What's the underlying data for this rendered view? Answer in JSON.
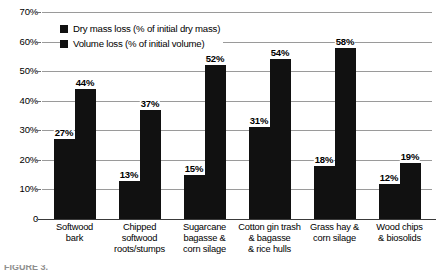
{
  "chart_data": {
    "type": "bar",
    "title": "",
    "xlabel": "",
    "ylabel": "",
    "ylim": [
      0,
      70
    ],
    "grid": true,
    "legend_position": "top-left-inside",
    "categories": [
      "Softwood\nbark",
      "Chipped\nsoftwood\nroots/stumps",
      "Sugarcane\nbagasse &\ncorn silage",
      "Cotton gin trash\n& bagasse\n& rice hulls",
      "Grass hay &\ncorn silage",
      "Wood chips\n& biosolids"
    ],
    "ytick_labels": [
      "70%",
      "60%",
      "50%",
      "40%",
      "30%",
      "20%",
      "10%",
      "0"
    ],
    "ytick_values": [
      70,
      60,
      50,
      40,
      30,
      20,
      10,
      0
    ],
    "series": [
      {
        "name": "Dry mass loss (% of initial dry mass)",
        "color": "#111111",
        "values": [
          27,
          13,
          15,
          31,
          18,
          12
        ],
        "labels": [
          "27%",
          "13%",
          "15%",
          "31%",
          "18%",
          "12%"
        ]
      },
      {
        "name": "Volume loss (% of initial volume)",
        "color": "#111111",
        "values": [
          44,
          37,
          52,
          54,
          58,
          19
        ],
        "labels": [
          "44%",
          "37%",
          "52%",
          "54%",
          "58%",
          "19%"
        ]
      }
    ]
  },
  "categories_display": [
    [
      "Softwood",
      "bark"
    ],
    [
      "Chipped",
      "softwood",
      "roots/stumps"
    ],
    [
      "Sugarcane",
      "bagasse &",
      "corn silage"
    ],
    [
      "Cotton gin trash",
      "& bagasse",
      "& rice hulls"
    ],
    [
      "Grass hay &",
      "corn silage"
    ],
    [
      "Wood chips",
      "& biosolids"
    ]
  ],
  "legend": {
    "items": [
      {
        "label": "Dry mass loss (% of initial dry mass)"
      },
      {
        "label": "Volume loss (% of initial volume)"
      }
    ]
  },
  "caption": {
    "clipped_text": "FIGURE 3."
  }
}
